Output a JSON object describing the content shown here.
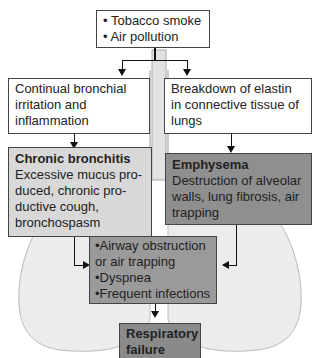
{
  "causes": {
    "items": [
      "• Tobacco smoke",
      "• Air pollution"
    ]
  },
  "left_path": {
    "mechanism": "Continual bronchial irritation and inflammation",
    "disease_title": "Chronic bronchitis",
    "disease_text": "Excessive mucus pro-duced, chronic pro-ductive cough, bronchospasm"
  },
  "right_path": {
    "mechanism": "Breakdown of elastin in connective tissue of lungs",
    "disease_title": "Emphysema",
    "disease_text": "Destruction of alveolar walls, lung fibrosis, air trapping"
  },
  "effects": {
    "items": [
      "•Airway obstruction",
      " or air trapping",
      "•Dyspnea",
      "•Frequent infections"
    ]
  },
  "outcome": {
    "title": "Respiratory failure"
  },
  "colors": {
    "light_box": "#d8d8d8",
    "mid_box": "#9a9a9a",
    "dark_box": "#8a8a8a",
    "lung": "#ededed"
  }
}
